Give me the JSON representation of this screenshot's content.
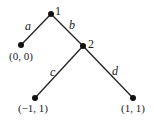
{
  "diagram": {
    "type": "game-tree",
    "nodes": [
      {
        "id": "1",
        "label": "1",
        "x": 51,
        "y": 14
      },
      {
        "id": "2",
        "label": "2",
        "x": 83,
        "y": 46
      },
      {
        "id": "leaf-a",
        "payoff": "(0, 0)",
        "x": 21,
        "y": 45
      },
      {
        "id": "leaf-c",
        "payoff": "(−1, 1)",
        "x": 35,
        "y": 98
      },
      {
        "id": "leaf-d",
        "payoff": "(1, 1)",
        "x": 133,
        "y": 98
      }
    ],
    "edges": [
      {
        "from": "1",
        "to": "leaf-a",
        "label": "a"
      },
      {
        "from": "1",
        "to": "2",
        "label": "b"
      },
      {
        "from": "2",
        "to": "leaf-c",
        "label": "c"
      },
      {
        "from": "2",
        "to": "leaf-d",
        "label": "d"
      }
    ],
    "colors": {
      "line": "#222222",
      "node": "#111111",
      "text": "#222222"
    }
  }
}
